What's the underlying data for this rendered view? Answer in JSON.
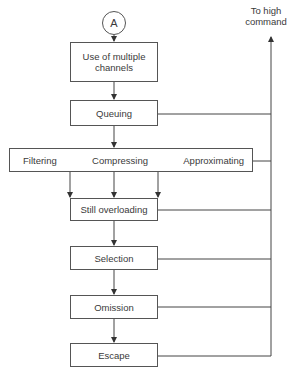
{
  "diagram": {
    "start_connector": "A",
    "exit_label": "To high command",
    "nodes": {
      "multiple_channels": "Use of multiple channels",
      "queuing": "Queuing",
      "filtering": "Filtering",
      "compressing": "Compressing",
      "approximating": "Approximating",
      "still_overloading": "Still overloading",
      "selection": "Selection",
      "omission": "Omission",
      "escape": "Escape"
    },
    "edges": [
      {
        "from": "A",
        "to": "multiple_channels"
      },
      {
        "from": "multiple_channels",
        "to": "queuing"
      },
      {
        "from": "queuing",
        "to": "filtering_compressing_approximating"
      },
      {
        "from": "queuing",
        "to": "high_command"
      },
      {
        "from": "filtering",
        "to": "still_overloading"
      },
      {
        "from": "compressing",
        "to": "still_overloading"
      },
      {
        "from": "approximating",
        "to": "still_overloading"
      },
      {
        "from": "filtering_compressing_approximating",
        "to": "high_command"
      },
      {
        "from": "still_overloading",
        "to": "selection"
      },
      {
        "from": "still_overloading",
        "to": "high_command"
      },
      {
        "from": "selection",
        "to": "omission"
      },
      {
        "from": "selection",
        "to": "high_command"
      },
      {
        "from": "omission",
        "to": "escape"
      },
      {
        "from": "omission",
        "to": "high_command"
      },
      {
        "from": "escape",
        "to": "high_command"
      }
    ],
    "colors": {
      "line": "#444444",
      "text": "#3a3a3a",
      "background": "#ffffff"
    }
  }
}
